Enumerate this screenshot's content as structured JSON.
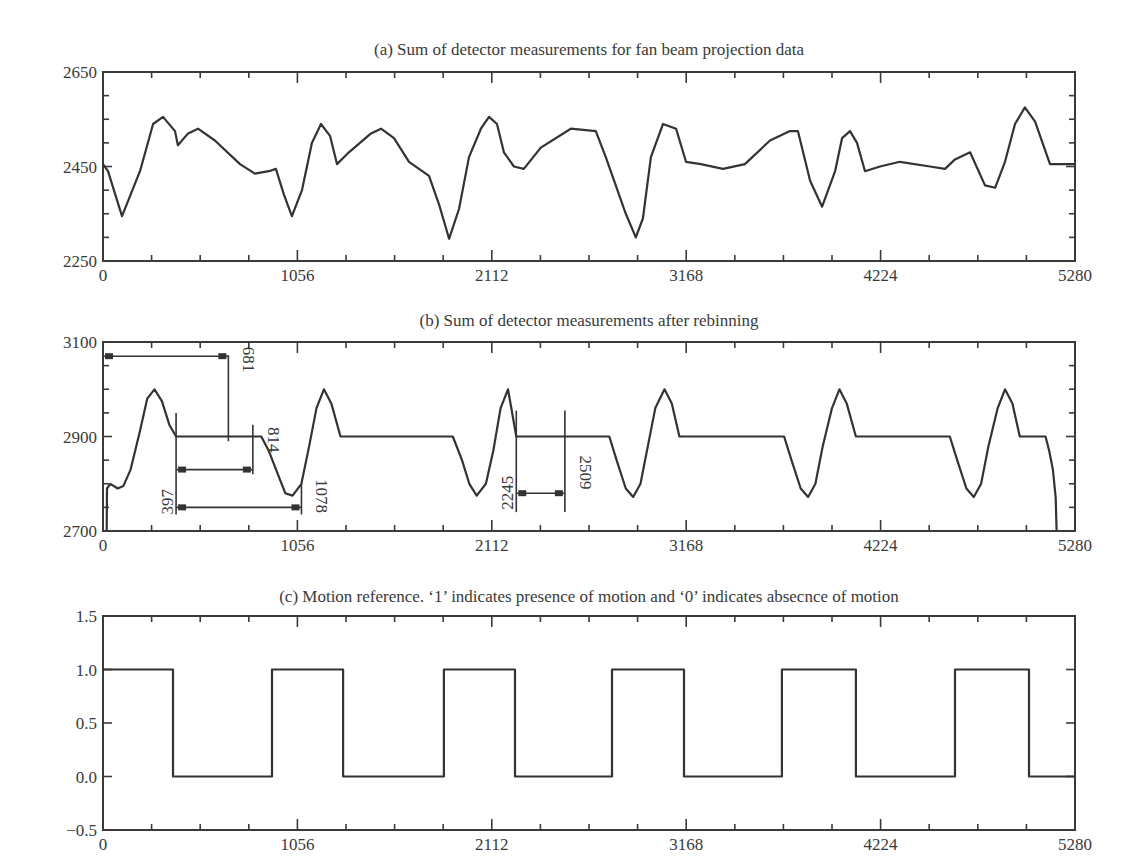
{
  "chart_data": [
    {
      "id": "a",
      "type": "line",
      "title": "(a) Sum of detector measurements for fan beam projection data",
      "xlabel": "",
      "ylabel": "",
      "xlim": [
        0,
        5280
      ],
      "ylim": [
        2250,
        2650
      ],
      "xticks": [
        "0",
        "1056",
        "2112",
        "3168",
        "4224",
        "5280"
      ],
      "yticks": [
        "2250",
        "2450",
        "2650"
      ],
      "grid": false,
      "series": [
        {
          "name": "fan beam sum",
          "x": [
            0,
            27,
            103,
            201,
            272,
            326,
            391,
            407,
            462,
            516,
            608,
            744,
            825,
            901,
            939,
            983,
            1026,
            1081,
            1135,
            1184,
            1233,
            1271,
            1336,
            1456,
            1510,
            1581,
            1662,
            1771,
            1825,
            1880,
            1934,
            1988,
            2053,
            2097,
            2140,
            2178,
            2232,
            2286,
            2378,
            2541,
            2677,
            2731,
            2840,
            2894,
            2933,
            2976,
            3042,
            3113,
            3167,
            3248,
            3368,
            3487,
            3623,
            3732,
            3775,
            3841,
            3906,
            3977,
            4015,
            4058,
            4096,
            4139,
            4221,
            4329,
            4492,
            4574,
            4628,
            4710,
            4791,
            4846,
            4900,
            4954,
            5008,
            5063,
            5144,
            5280
          ],
          "values": [
            2455,
            2440,
            2345,
            2440,
            2540,
            2555,
            2525,
            2495,
            2520,
            2530,
            2505,
            2455,
            2435,
            2440,
            2445,
            2390,
            2345,
            2400,
            2500,
            2540,
            2515,
            2455,
            2480,
            2520,
            2530,
            2510,
            2460,
            2430,
            2370,
            2297,
            2360,
            2470,
            2530,
            2555,
            2540,
            2480,
            2450,
            2445,
            2490,
            2530,
            2525,
            2470,
            2350,
            2300,
            2340,
            2470,
            2540,
            2530,
            2460,
            2455,
            2445,
            2455,
            2505,
            2525,
            2525,
            2420,
            2365,
            2440,
            2510,
            2525,
            2500,
            2440,
            2450,
            2460,
            2450,
            2445,
            2465,
            2480,
            2410,
            2405,
            2460,
            2540,
            2575,
            2545,
            2455,
            2455
          ]
        }
      ]
    },
    {
      "id": "b",
      "type": "line",
      "title": "(b) Sum of detector measurements after rebinning",
      "xlabel": "",
      "ylabel": "",
      "xlim": [
        0,
        5280
      ],
      "ylim": [
        2700,
        3100
      ],
      "xticks": [
        "0",
        "1056",
        "2112",
        "3168",
        "4224",
        "5280"
      ],
      "yticks": [
        "2700",
        "2900",
        "3100"
      ],
      "grid": false,
      "series": [
        {
          "name": "rebinned sum",
          "x": [
            20,
            22,
            40,
            80,
            110,
            150,
            200,
            240,
            280,
            320,
            360,
            397,
            860,
            900,
            950,
            990,
            1030,
            1078,
            1120,
            1160,
            1200,
            1240,
            1290,
            1900,
            1950,
            1990,
            2030,
            2080,
            2120,
            2160,
            2200,
            2245,
            2750,
            2790,
            2840,
            2880,
            2920,
            2960,
            3000,
            3050,
            3090,
            3131,
            3700,
            3740,
            3790,
            3830,
            3870,
            3910,
            3960,
            4000,
            4040,
            4090,
            4600,
            4640,
            4690,
            4730,
            4770,
            4810,
            4860,
            4900,
            4940,
            4980,
            5120,
            5140,
            5160,
            5175,
            5180
          ],
          "values": [
            2700,
            2790,
            2800,
            2790,
            2795,
            2830,
            2910,
            2980,
            3000,
            2975,
            2925,
            2900,
            2900,
            2870,
            2820,
            2780,
            2775,
            2800,
            2880,
            2960,
            3000,
            2970,
            2900,
            2900,
            2850,
            2800,
            2775,
            2800,
            2870,
            2960,
            3000,
            2900,
            2900,
            2850,
            2790,
            2772,
            2800,
            2880,
            2960,
            3000,
            2970,
            2900,
            2900,
            2850,
            2790,
            2772,
            2800,
            2880,
            2960,
            3000,
            2970,
            2900,
            2900,
            2850,
            2790,
            2772,
            2800,
            2880,
            2960,
            3000,
            2970,
            2900,
            2900,
            2870,
            2830,
            2770,
            2700
          ]
        }
      ],
      "annotations": [
        {
          "label": "681",
          "from": 0,
          "to": 681,
          "arrow_y": 3070
        },
        {
          "label": "397",
          "value": 397
        },
        {
          "label": "814",
          "from": 397,
          "to": 814,
          "arrow_y": 2830
        },
        {
          "label": "1078",
          "from": 397,
          "to": 1078,
          "arrow_y": 2750
        },
        {
          "label": "2245",
          "value": 2245
        },
        {
          "label": "2509",
          "from": 2245,
          "to": 2509,
          "arrow_y": 2780
        }
      ]
    },
    {
      "id": "c",
      "type": "line",
      "title": "(c) Motion reference. ‘1’ indicates presence of motion and ‘0’ indicates absecnce of motion",
      "xlabel": "",
      "ylabel": "",
      "xlim": [
        0,
        5280
      ],
      "ylim": [
        -0.5,
        1.5
      ],
      "xticks": [
        "0",
        "1056",
        "2112",
        "3168",
        "4224",
        "5280"
      ],
      "yticks": [
        "−0.5",
        "0.0",
        "0.5",
        "1.0",
        "1.5"
      ],
      "grid": false,
      "series": [
        {
          "name": "motion reference",
          "step_transitions": [
            0,
            380,
            918,
            1304,
            1852,
            2238,
            2765,
            3156,
            3688,
            4090,
            4628,
            5030,
            5280
          ],
          "levels": [
            1,
            0,
            1,
            0,
            1,
            0,
            1,
            0,
            1,
            0,
            1,
            0
          ]
        }
      ]
    }
  ]
}
